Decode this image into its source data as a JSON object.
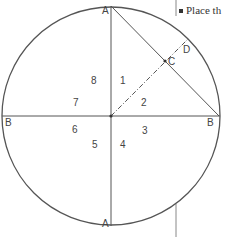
{
  "caption": {
    "text": "Place th"
  },
  "points": {
    "A_top": "A",
    "A_bottom": "A",
    "B_left": "B",
    "B_right": "B",
    "C": "C",
    "D": "D"
  },
  "regions": [
    "1",
    "2",
    "3",
    "4",
    "5",
    "6",
    "7",
    "8"
  ]
}
